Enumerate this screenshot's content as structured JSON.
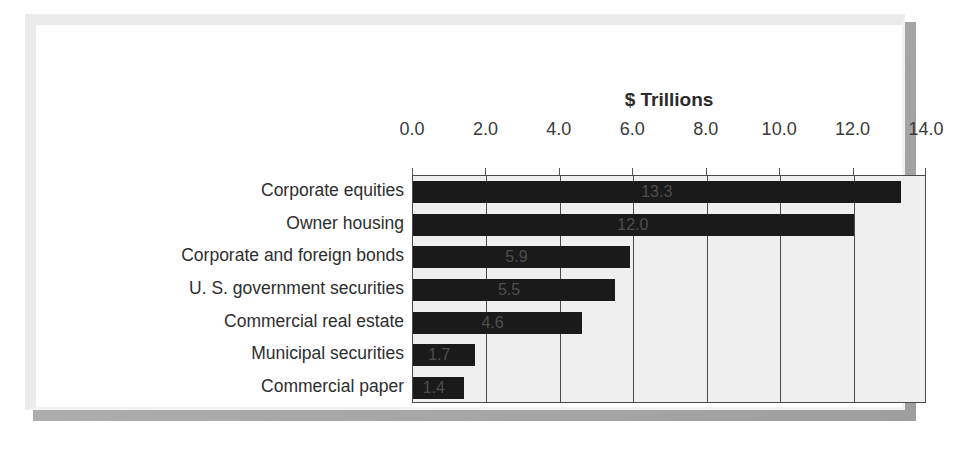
{
  "chart_data": {
    "type": "bar",
    "orientation": "horizontal",
    "title": "$ Trillions",
    "xlabel": "",
    "ylabel": "",
    "xlim": [
      0.0,
      14.0
    ],
    "xtick_step": 2.0,
    "xticks": [
      "0.0",
      "2.0",
      "4.0",
      "6.0",
      "8.0",
      "10.0",
      "12.0",
      "14.0"
    ],
    "grid": "vertical",
    "legend": "none",
    "axis_position": "top",
    "categories": [
      "Corporate equities",
      "Owner housing",
      "Corporate and foreign bonds",
      "U. S. government securities",
      "Commercial real estate",
      "Municipal securities",
      "Commercial paper"
    ],
    "values": [
      13.3,
      12.0,
      5.9,
      5.5,
      4.6,
      1.7,
      1.4
    ],
    "data_labels": [
      "13.3",
      "12.0",
      "5.9",
      "5.5",
      "4.6",
      "1.7",
      "1.4"
    ],
    "colors": {
      "bar": "#1a1a1a",
      "plot_background": "#efefef",
      "gridline": "#4a4a4a",
      "axis_border": "#4a4a4a",
      "text": "#2e2e2e",
      "data_label": "#4e4e4e",
      "card_background": "#ffffff",
      "frame": "#ebebeb",
      "shadow": "#a9a9a9"
    }
  }
}
